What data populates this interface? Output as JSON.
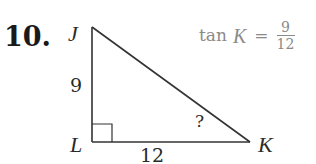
{
  "problem": {
    "number": "10.",
    "formula": {
      "func": "tan",
      "angle": "K",
      "equals": "=",
      "numerator": "9",
      "denominator": "12"
    },
    "triangle": {
      "vertices": {
        "top": "J",
        "right_angle": "L",
        "acute": "K"
      },
      "side_labels": {
        "JL": "9",
        "LK": "12"
      },
      "unknown_angle_marker": "?"
    },
    "colors": {
      "ink": "#2a2a2a",
      "formula": "#8a8a8a"
    }
  }
}
